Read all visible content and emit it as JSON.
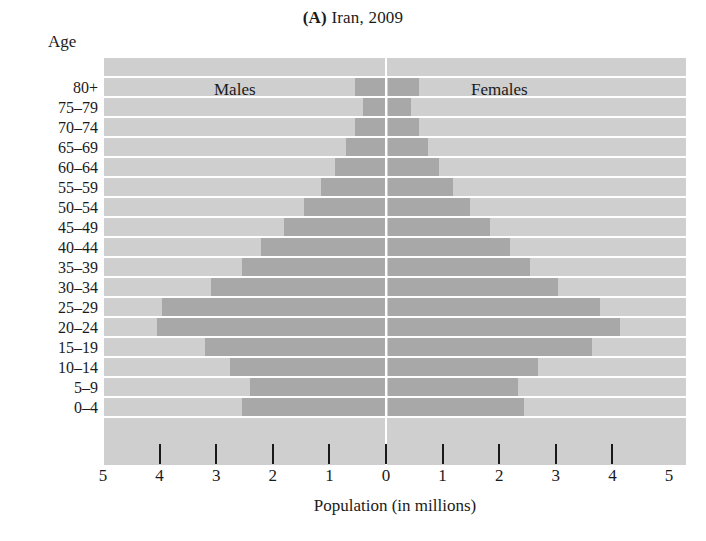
{
  "figure": {
    "panel_letter": "(A)",
    "title_text": "Iran, 2009",
    "age_axis_title": "Age",
    "x_axis_title": "Population (in millions)",
    "males_label": "Males",
    "females_label": "Females",
    "colors": {
      "plot_background": "#cfcfcf",
      "bar_fill": "#a8a8a8",
      "gridline": "#ffffff",
      "text": "#1a1a1a",
      "page_background": "#ffffff"
    }
  },
  "chart_data": {
    "type": "bar",
    "subtype": "population-pyramid",
    "title": "(A) Iran, 2009",
    "xlabel": "Population (in millions)",
    "ylabel": "Age",
    "xlim": [
      -5,
      5
    ],
    "xtick_labels": [
      "5",
      "4",
      "3",
      "2",
      "1",
      "0",
      "1",
      "2",
      "3",
      "4",
      "5"
    ],
    "xtick_values": [
      -5,
      -4,
      -3,
      -2,
      -1,
      0,
      1,
      2,
      3,
      4,
      5
    ],
    "grid": true,
    "legend_position": "inside-plot",
    "categories": [
      "80+",
      "75–79",
      "70–74",
      "65–69",
      "60–64",
      "55–59",
      "50–54",
      "45–49",
      "40–44",
      "35–39",
      "30–34",
      "25–29",
      "20–24",
      "15–19",
      "10–14",
      "5–9",
      "0–4"
    ],
    "series": [
      {
        "name": "Males",
        "side": "left",
        "values": [
          0.55,
          0.4,
          0.55,
          0.7,
          0.9,
          1.15,
          1.45,
          1.8,
          2.2,
          2.55,
          3.1,
          3.95,
          4.05,
          3.2,
          2.75,
          2.4,
          2.55
        ]
      },
      {
        "name": "Females",
        "side": "right",
        "values": [
          0.55,
          0.4,
          0.55,
          0.7,
          0.9,
          1.15,
          1.45,
          1.8,
          2.15,
          2.5,
          3.0,
          3.75,
          4.1,
          3.6,
          2.65,
          2.3,
          2.4
        ]
      }
    ]
  }
}
